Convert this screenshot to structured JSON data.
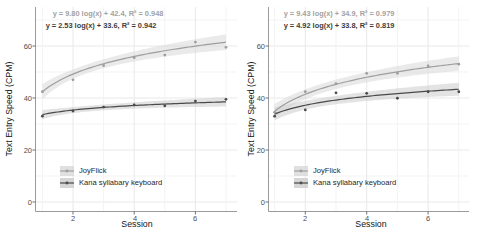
{
  "figure": {
    "type": "faceted scatter with log fits and confidence bands",
    "background": "#ffffff",
    "panels": 2
  },
  "colors": {
    "joyflick_line": "#9e9e9e",
    "kana_line": "#4a4a4a",
    "joyflick_band": "#d8d8d8",
    "kana_band": "#cccccc",
    "grid_major": "#e8e8e8",
    "grid_minor": "#f3f3f3",
    "axis": "#9a9a9a",
    "tick": "#707070",
    "eq_joyflick_text": "#a2a2a2",
    "eq_kana_text": "#3d3d3d"
  },
  "chart_data": [
    {
      "type": "scatter",
      "panel": "left",
      "x": [
        1,
        2,
        3,
        4,
        5,
        6,
        7
      ],
      "xlabel": "Session",
      "ylabel": "Text Entry Speed (CPM)",
      "xticks": [
        2,
        4,
        6
      ],
      "yticks": [
        0,
        20,
        40,
        60
      ],
      "ylim": [
        -4,
        75
      ],
      "grid": true,
      "legend_position": "inside-bottom-left",
      "series": [
        {
          "name": "JoyFlick",
          "values": [
            42.4,
            47.0,
            52.5,
            55.5,
            56.5,
            61.5,
            59.5
          ],
          "fit": {
            "model": "y = a*log(x) + b",
            "a": 9.8,
            "b": 42.4,
            "r2": 0.948
          },
          "equation": "y = 9.80 log(x) + 42.4, R² = 0.948",
          "ci_halfwidth_mid": 1.7,
          "ci_halfwidth_end": 3.0
        },
        {
          "name": "Kana syllabary keyboard",
          "values": [
            33.0,
            35.0,
            36.5,
            37.3,
            37.0,
            38.8,
            39.5
          ],
          "fit": {
            "model": "y = a*log(x) + b",
            "a": 2.53,
            "b": 33.6,
            "r2": 0.942
          },
          "equation": "y = 2.53 log(x) + 33.6, R² = 0.942",
          "ci_halfwidth_mid": 1.1,
          "ci_halfwidth_end": 1.8
        }
      ]
    },
    {
      "type": "scatter",
      "panel": "right",
      "x": [
        1,
        2,
        3,
        4,
        5,
        6,
        7
      ],
      "xlabel": "Session",
      "ylabel": "Text Entry Speed (CPM)",
      "xticks": [
        2,
        4,
        6
      ],
      "yticks": [
        0,
        20,
        40,
        60
      ],
      "ylim": [
        -4,
        75
      ],
      "grid": true,
      "legend_position": "inside-bottom-left",
      "series": [
        {
          "name": "JoyFlick",
          "values": [
            34.5,
            42.4,
            45.5,
            49.5,
            49.5,
            52.3,
            53.0
          ],
          "fit": {
            "model": "y = a*log(x) + b",
            "a": 9.43,
            "b": 34.9,
            "r2": 0.979
          },
          "equation": "y = 9.43 log(x) + 34.9, R² = 0.979",
          "ci_halfwidth_mid": 1.8,
          "ci_halfwidth_end": 2.8
        },
        {
          "name": "Kana syllabary keyboard",
          "values": [
            33.0,
            35.4,
            42.0,
            41.8,
            39.9,
            42.4,
            42.4
          ],
          "fit": {
            "model": "y = a*log(x) + b",
            "a": 4.92,
            "b": 33.8,
            "r2": 0.819
          },
          "equation": "y = 4.92 log(x) + 33.8, R² = 0.819",
          "ci_halfwidth_mid": 1.6,
          "ci_halfwidth_end": 2.5
        }
      ]
    }
  ]
}
